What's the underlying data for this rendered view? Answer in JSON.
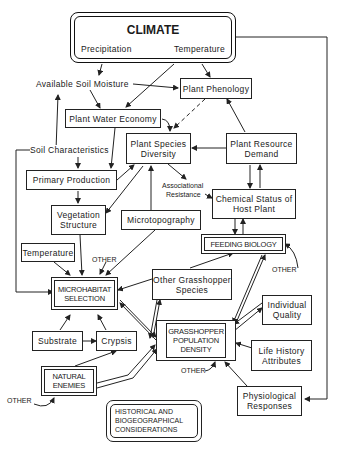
{
  "diagram": {
    "climate": {
      "title": "CLIMATE",
      "sub_left": "Precipitation",
      "sub_right": "Temperature"
    },
    "labels": {
      "available_soil_moisture": "Available Soil Moisture",
      "soil_characteristics": "Soil Characteristics",
      "associational_resistance_1": "Associational",
      "associational_resistance_2": "Resistance",
      "other_microhabitat": "OTHER",
      "other_feeding": "OTHER",
      "other_population": "OTHER",
      "other_enemies": "OTHER"
    },
    "nodes": {
      "plant_phenology": "Plant Phenology",
      "plant_water_economy": "Plant Water Economy",
      "plant_species_diversity_1": "Plant Species",
      "plant_species_diversity_2": "Diversity",
      "plant_resource_demand_1": "Plant Resource",
      "plant_resource_demand_2": "Demand",
      "primary_production": "Primary Production",
      "chemical_status_1": "Chemical Status of",
      "chemical_status_2": "Host Plant",
      "vegetation_structure_1": "Vegetation",
      "vegetation_structure_2": "Structure",
      "microtopography": "Microtopography",
      "feeding_biology": "FEEDING BIOLOGY",
      "temperature": "Temperature",
      "microhabitat_selection_1": "MICROHABITAT",
      "microhabitat_selection_2": "SELECTION",
      "other_grasshopper_species_1": "Other Grasshopper",
      "other_grasshopper_species_2": "Species",
      "individual_quality_1": "Individual",
      "individual_quality_2": "Quality",
      "substrate": "Substrate",
      "crypsis": "Crypsis",
      "grasshopper_population_density_1": "GRASSHOPPER",
      "grasshopper_population_density_2": "POPULATION",
      "grasshopper_population_density_3": "DENSITY",
      "life_history_attributes_1": "Life History",
      "life_history_attributes_2": "Attributes",
      "natural_enemies_1": "NATURAL",
      "natural_enemies_2": "ENEMIES",
      "physiological_responses_1": "Physiological",
      "physiological_responses_2": "Responses"
    },
    "historical": {
      "line1": "HISTORICAL AND",
      "line2": "BIOGEOGRAPHICAL",
      "line3": "CONSIDERATIONS"
    }
  }
}
